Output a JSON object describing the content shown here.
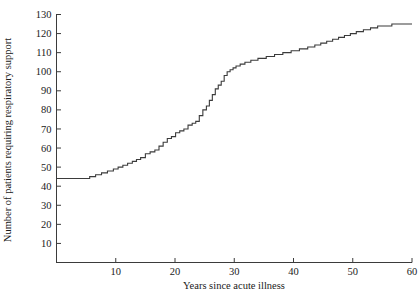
{
  "chart_data": {
    "type": "line",
    "subtype": "step",
    "title": "",
    "xlabel": "Years since acute illness",
    "ylabel": "Number of patients requiring respiratory support",
    "xlim": [
      0,
      60
    ],
    "ylim": [
      0,
      130
    ],
    "xticks": [
      10,
      20,
      30,
      40,
      50,
      60
    ],
    "xtick_labels": [
      "10",
      "20",
      "30",
      "40",
      "50",
      "60"
    ],
    "yticks": [
      10,
      20,
      30,
      40,
      50,
      60,
      70,
      80,
      90,
      100,
      110,
      120,
      130
    ],
    "ytick_labels": [
      "10",
      "20",
      "30",
      "40",
      "50",
      "60",
      "70",
      "80",
      "90",
      "100",
      "110",
      "120",
      "130"
    ],
    "grid": false,
    "legend": null,
    "line_color": "#3b3b3b",
    "axis_color": "#3b3b3b",
    "background": "#ffffff",
    "step_mode": "post",
    "x": [
      0.0,
      5.6,
      6.6,
      7.6,
      8.6,
      9.6,
      10.4,
      11.2,
      12.0,
      12.8,
      13.5,
      14.2,
      15.0,
      15.8,
      16.6,
      17.3,
      18.0,
      18.7,
      19.4,
      20.1,
      20.8,
      21.5,
      22.2,
      22.9,
      23.5,
      24.1,
      24.7,
      25.3,
      25.8,
      26.3,
      26.8,
      27.3,
      27.8,
      28.3,
      28.8,
      29.3,
      29.8,
      30.3,
      31.0,
      31.8,
      32.8,
      34.0,
      35.4,
      36.8,
      38.2,
      39.6,
      41.0,
      42.4,
      43.6,
      44.6,
      45.6,
      46.6,
      47.6,
      48.6,
      49.6,
      50.6,
      51.8,
      53.0,
      54.2,
      55.4,
      56.6,
      57.8,
      59.0,
      60.0
    ],
    "y": [
      44,
      45,
      46,
      47,
      48,
      49,
      50,
      51,
      52,
      53,
      54,
      55,
      57,
      58,
      59,
      61,
      63,
      65,
      66,
      68,
      69,
      70,
      72,
      73,
      74,
      77,
      80,
      82,
      85,
      88,
      91,
      93,
      95,
      98,
      100,
      101,
      102,
      103,
      104,
      105,
      106,
      107,
      108,
      109,
      110,
      111,
      112,
      113,
      114,
      115,
      116,
      117,
      118,
      119,
      120,
      121,
      122,
      123,
      124,
      124,
      125,
      125,
      125,
      125
    ]
  },
  "axes": {
    "y_axis_title": "Number of patients requiring respiratory support",
    "x_axis_title": "Years since acute illness"
  }
}
